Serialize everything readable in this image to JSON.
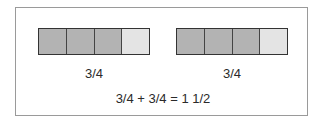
{
  "diagram": {
    "bars": [
      {
        "label": "3/4",
        "cells": [
          {
            "filled": true,
            "width": 26
          },
          {
            "filled": true,
            "width": 29
          },
          {
            "filled": true,
            "width": 28
          },
          {
            "filled": false,
            "width": 28
          }
        ]
      },
      {
        "label": "3/4",
        "cells": [
          {
            "filled": true,
            "width": 26
          },
          {
            "filled": true,
            "width": 28
          },
          {
            "filled": true,
            "width": 28
          },
          {
            "filled": false,
            "width": 28
          }
        ]
      }
    ],
    "equation": "3/4 + 3/4 = 1 1/2",
    "colors": {
      "filled": "#b3b3b3",
      "empty": "#e4e4e4",
      "border": "#333333",
      "frame": "#9a9a9a"
    }
  }
}
